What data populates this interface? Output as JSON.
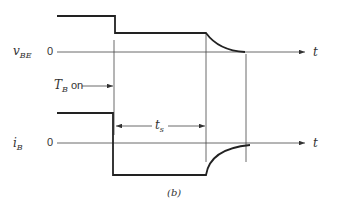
{
  "figure": {
    "caption": "(b)",
    "signals": [
      {
        "name": "v",
        "subscript": "BE",
        "zero_label": "0",
        "axis_label": "t"
      },
      {
        "name": "i",
        "subscript": "B",
        "zero_label": "0",
        "axis_label": "t"
      }
    ],
    "annotations": {
      "tb_on": {
        "main": "T",
        "subscript": "B",
        "suffix": " on"
      },
      "ts": {
        "main": "t",
        "subscript": "s"
      }
    }
  }
}
